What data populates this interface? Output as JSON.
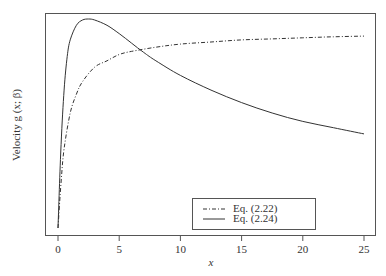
{
  "chart_data": {
    "type": "line",
    "title": "",
    "xlabel": "x",
    "ylabel": "Velocity g (x; β)",
    "xlim": [
      -1,
      26
    ],
    "ylim": [
      0,
      1.05
    ],
    "xticks": [
      0,
      5,
      10,
      15,
      20,
      25
    ],
    "xtick_labels": [
      "0",
      "5",
      "10",
      "15",
      "20",
      "25"
    ],
    "yticks": [],
    "grid": false,
    "legend_position": "lower right (inside plot)",
    "series": [
      {
        "name": "Eq. (2.22)",
        "style": "dash-dot",
        "x": [
          0,
          0.25,
          0.5,
          1,
          1.5,
          2,
          3,
          4,
          5,
          6,
          8,
          10,
          12.5,
          15,
          17.5,
          20,
          22.5,
          25
        ],
        "y": [
          0.0,
          0.22,
          0.38,
          0.55,
          0.64,
          0.7,
          0.77,
          0.8,
          0.83,
          0.845,
          0.865,
          0.88,
          0.89,
          0.9,
          0.905,
          0.91,
          0.915,
          0.918
        ]
      },
      {
        "name": "Eq. (2.24)",
        "style": "solid",
        "x": [
          0,
          0.25,
          0.5,
          0.75,
          1,
          1.5,
          2,
          2.5,
          3,
          4,
          5,
          6,
          7,
          8,
          10,
          12.5,
          15,
          17.5,
          20,
          22.5,
          25
        ],
        "y": [
          0.0,
          0.4,
          0.66,
          0.82,
          0.9,
          0.97,
          0.995,
          1.0,
          0.995,
          0.97,
          0.93,
          0.885,
          0.84,
          0.8,
          0.73,
          0.66,
          0.6,
          0.55,
          0.51,
          0.48,
          0.45
        ]
      }
    ]
  },
  "legend": {
    "items": [
      {
        "label": "Eq. (2.22)"
      },
      {
        "label": "Eq. (2.24)"
      }
    ]
  },
  "axes": {
    "xlabel": "x",
    "ylabel": "Velocity g (x; β)"
  }
}
